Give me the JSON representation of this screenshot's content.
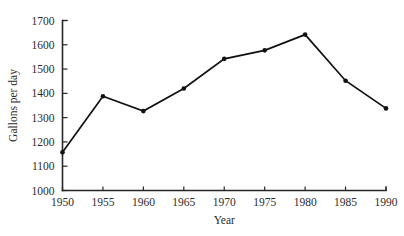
{
  "chart_data": {
    "type": "line",
    "title": "",
    "subtitle": "",
    "xlabel": "Year",
    "ylabel": "Gallons per day",
    "x": [
      1950,
      1955,
      1960,
      1965,
      1970,
      1975,
      1980,
      1985,
      1990
    ],
    "values": [
      1157,
      1388,
      1327,
      1420,
      1542,
      1577,
      1642,
      1452,
      1338
    ],
    "categories": [
      "1950",
      "1955",
      "1960",
      "1965",
      "1970",
      "1975",
      "1980",
      "1985",
      "1990"
    ],
    "xtick_labels": [
      "1950",
      "1955",
      "1960",
      "1965",
      "1970",
      "1975",
      "1980",
      "1985",
      "1990"
    ],
    "ytick_labels": [
      "1000",
      "1100",
      "1200",
      "1300",
      "1400",
      "1500",
      "1600",
      "1700"
    ],
    "yticks": [
      1000,
      1100,
      1200,
      1300,
      1400,
      1500,
      1600,
      1700
    ],
    "xlim": [
      1950,
      1990
    ],
    "ylim": [
      1000,
      1700
    ],
    "grid": false,
    "legend": false,
    "legend_position": "none",
    "series": [
      {
        "name": "Gallons per day",
        "values": [
          1157,
          1388,
          1327,
          1420,
          1542,
          1577,
          1642,
          1452,
          1338
        ],
        "color": "#111111",
        "marker": "circle"
      }
    ],
    "annotations": []
  },
  "axes": {
    "x_title": "Year",
    "y_title": "Gallons per day"
  },
  "colors": {
    "line": "#111111",
    "axis": "#262626",
    "text": "#2b2b2b",
    "background": "#ffffff"
  }
}
